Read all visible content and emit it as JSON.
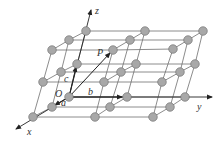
{
  "figure": {
    "axes": {
      "x_label": "x",
      "y_label": "y",
      "z_label": "z"
    },
    "origin_label": "O",
    "basis_vectors": {
      "a": "a",
      "b": "b",
      "c": "c"
    },
    "point_label": "P",
    "colors": {
      "atom_fill": "#a8a8a8",
      "atom_stroke": "#666666",
      "line": "#6e6e6e",
      "axis": "#222222"
    }
  }
}
